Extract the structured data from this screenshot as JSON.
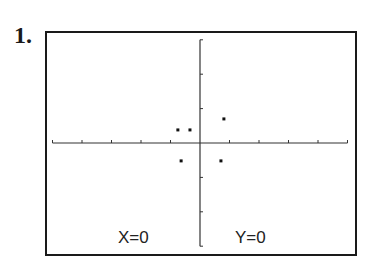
{
  "problem_number": "1.",
  "readout": {
    "x_label": "X=0",
    "y_label": "Y=0"
  },
  "chart_data": {
    "type": "scatter",
    "title": "",
    "xlabel": "",
    "ylabel": "",
    "xlim": [
      -5,
      5
    ],
    "ylim": [
      -3,
      3
    ],
    "x_ticks": [
      -5,
      -4,
      -3,
      -2,
      -1,
      1,
      2,
      3,
      4,
      5
    ],
    "y_ticks": [
      -3,
      -2,
      -1,
      1,
      2,
      3
    ],
    "grid": false,
    "points": [
      {
        "x": -0.75,
        "y": 0.38
      },
      {
        "x": -0.34,
        "y": 0.38
      },
      {
        "x": 0.81,
        "y": 0.7
      },
      {
        "x": -0.64,
        "y": -0.52
      },
      {
        "x": 0.71,
        "y": -0.52
      }
    ],
    "cursor_readout": {
      "x": 0,
      "y": 0
    },
    "colors": {
      "axis": "#333333",
      "points": "#111111",
      "frame": "#1a1a1a"
    }
  }
}
